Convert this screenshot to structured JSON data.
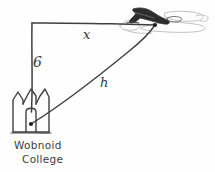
{
  "figure": {
    "style": "hand-drawn pencil sketch",
    "background_color": "#fefefe",
    "ink_color": "#3a3a3a",
    "faint_ink_color": "#b9b9b9"
  },
  "labels": {
    "horizontal_leg": "x",
    "vertical_leg": "6",
    "hypotenuse": "h"
  },
  "caption": {
    "line1": "Wobnoid",
    "line2": "College"
  },
  "objects": {
    "airplane": "airplane-icon",
    "building": "college-building-icon",
    "corner_vertex": "right-angle-vertex",
    "plane_vertex": "airplane-point",
    "college_vertex": "college-point"
  },
  "geometry": {
    "right_angle_corner": [
      32,
      23
    ],
    "airplane_point": [
      155,
      25
    ],
    "college_point": [
      31,
      124
    ],
    "vertical_leg_from": [
      32,
      23
    ],
    "vertical_leg_to": [
      32,
      110
    ],
    "horizontal_leg_from": [
      32,
      23
    ],
    "horizontal_leg_to": [
      155,
      25
    ]
  }
}
